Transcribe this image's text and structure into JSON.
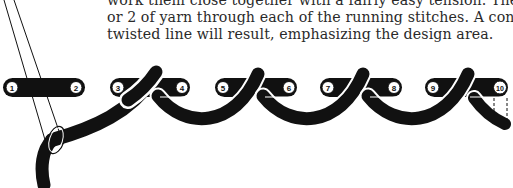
{
  "document": {
    "paragraph_lines": [
      "work them close together with a fairly easy tension. Then loop another",
      "or 2 of yarn through each of the running stitches. A continuous,",
      "twisted line will result, emphasizing the design area."
    ]
  },
  "diagram": {
    "stitch_labels": [
      "1",
      "2",
      "3",
      "4",
      "5",
      "6",
      "7",
      "8",
      "9",
      "10"
    ],
    "colors": {
      "ink": "#111111",
      "paper": "#ffffff"
    }
  }
}
